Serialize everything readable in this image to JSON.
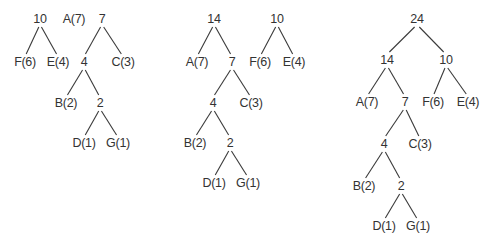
{
  "diagram": {
    "type": "huffman-tree-construction",
    "colors": {
      "text": "#333333",
      "edge": "#3a3a3a",
      "background": "#ffffff"
    },
    "panels": [
      {
        "id": "step1",
        "nodes": [
          {
            "id": "n10",
            "label": "10",
            "x": 40,
            "y": 19
          },
          {
            "id": "F",
            "label": "F(6)",
            "x": 25,
            "y": 62
          },
          {
            "id": "E",
            "label": "E(4)",
            "x": 58,
            "y": 62
          },
          {
            "id": "A",
            "label": "A(7)",
            "x": 74,
            "y": 19
          },
          {
            "id": "n7",
            "label": "7",
            "x": 102,
            "y": 19
          },
          {
            "id": "n4",
            "label": "4",
            "x": 84,
            "y": 62
          },
          {
            "id": "C",
            "label": "C(3)",
            "x": 123,
            "y": 62
          },
          {
            "id": "B",
            "label": "B(2)",
            "x": 66,
            "y": 103
          },
          {
            "id": "n2",
            "label": "2",
            "x": 100,
            "y": 103
          },
          {
            "id": "D",
            "label": "D(1)",
            "x": 84,
            "y": 143
          },
          {
            "id": "G",
            "label": "G(1)",
            "x": 118,
            "y": 143
          }
        ],
        "edges": [
          [
            "n10",
            "F"
          ],
          [
            "n10",
            "E"
          ],
          [
            "n7",
            "n4"
          ],
          [
            "n7",
            "C"
          ],
          [
            "n4",
            "B"
          ],
          [
            "n4",
            "n2"
          ],
          [
            "n2",
            "D"
          ],
          [
            "n2",
            "G"
          ]
        ]
      },
      {
        "id": "step2",
        "nodes": [
          {
            "id": "n14",
            "label": "14",
            "x": 214,
            "y": 19
          },
          {
            "id": "A",
            "label": "A(7)",
            "x": 197,
            "y": 62
          },
          {
            "id": "n7",
            "label": "7",
            "x": 232,
            "y": 62
          },
          {
            "id": "n10",
            "label": "10",
            "x": 277,
            "y": 19
          },
          {
            "id": "F",
            "label": "F(6)",
            "x": 260,
            "y": 62
          },
          {
            "id": "E",
            "label": "E(4)",
            "x": 294,
            "y": 62
          },
          {
            "id": "n4",
            "label": "4",
            "x": 213,
            "y": 103
          },
          {
            "id": "C",
            "label": "C(3)",
            "x": 251,
            "y": 103
          },
          {
            "id": "B",
            "label": "B(2)",
            "x": 195,
            "y": 143
          },
          {
            "id": "n2",
            "label": "2",
            "x": 230,
            "y": 143
          },
          {
            "id": "D",
            "label": "D(1)",
            "x": 214,
            "y": 183
          },
          {
            "id": "G",
            "label": "G(1)",
            "x": 248,
            "y": 183
          }
        ],
        "edges": [
          [
            "n14",
            "A"
          ],
          [
            "n14",
            "n7"
          ],
          [
            "n10",
            "F"
          ],
          [
            "n10",
            "E"
          ],
          [
            "n7",
            "n4"
          ],
          [
            "n7",
            "C"
          ],
          [
            "n4",
            "B"
          ],
          [
            "n4",
            "n2"
          ],
          [
            "n2",
            "D"
          ],
          [
            "n2",
            "G"
          ]
        ]
      },
      {
        "id": "step3",
        "nodes": [
          {
            "id": "n24",
            "label": "24",
            "x": 417,
            "y": 19
          },
          {
            "id": "n14",
            "label": "14",
            "x": 387,
            "y": 60
          },
          {
            "id": "n10",
            "label": "10",
            "x": 446,
            "y": 60
          },
          {
            "id": "A",
            "label": "A(7)",
            "x": 367,
            "y": 102
          },
          {
            "id": "n7",
            "label": "7",
            "x": 405,
            "y": 102
          },
          {
            "id": "F",
            "label": "F(6)",
            "x": 433,
            "y": 102
          },
          {
            "id": "E",
            "label": "E(4)",
            "x": 468,
            "y": 102
          },
          {
            "id": "n4",
            "label": "4",
            "x": 384,
            "y": 144
          },
          {
            "id": "C",
            "label": "C(3)",
            "x": 420,
            "y": 144
          },
          {
            "id": "B",
            "label": "B(2)",
            "x": 364,
            "y": 186
          },
          {
            "id": "n2",
            "label": "2",
            "x": 401,
            "y": 186
          },
          {
            "id": "D",
            "label": "D(1)",
            "x": 384,
            "y": 226
          },
          {
            "id": "G",
            "label": "G(1)",
            "x": 418,
            "y": 226
          }
        ],
        "edges": [
          [
            "n24",
            "n14"
          ],
          [
            "n24",
            "n10"
          ],
          [
            "n14",
            "A"
          ],
          [
            "n14",
            "n7"
          ],
          [
            "n10",
            "F"
          ],
          [
            "n10",
            "E"
          ],
          [
            "n7",
            "n4"
          ],
          [
            "n7",
            "C"
          ],
          [
            "n4",
            "B"
          ],
          [
            "n4",
            "n2"
          ],
          [
            "n2",
            "D"
          ],
          [
            "n2",
            "G"
          ]
        ]
      }
    ]
  }
}
